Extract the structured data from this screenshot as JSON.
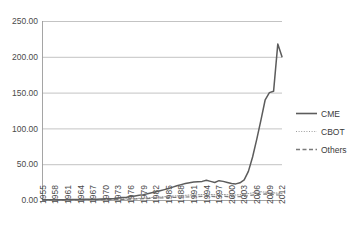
{
  "chart_data": {
    "type": "line",
    "title": "",
    "xlabel": "",
    "ylabel": "",
    "grid": true,
    "legend_position": "right",
    "ylim": [
      0,
      250
    ],
    "ytick_labels": [
      "0.00",
      "50.00",
      "100.00",
      "150.00",
      "200.00",
      "250.00"
    ],
    "ytick_values": [
      0,
      50,
      100,
      150,
      200,
      250
    ],
    "xtick_labels": [
      "1955",
      "1958",
      "1961",
      "1964",
      "1967",
      "1970",
      "1973",
      "1976",
      "1979",
      "1982",
      "1985",
      "1988",
      "1991",
      "1994",
      "1997",
      "2000",
      "2003",
      "2006",
      "2009",
      "2012"
    ],
    "x": [
      1955,
      1956,
      1957,
      1958,
      1959,
      1960,
      1961,
      1962,
      1963,
      1964,
      1965,
      1966,
      1967,
      1968,
      1969,
      1970,
      1971,
      1972,
      1973,
      1974,
      1975,
      1976,
      1977,
      1978,
      1979,
      1980,
      1981,
      1982,
      1983,
      1984,
      1985,
      1986,
      1987,
      1988,
      1989,
      1990,
      1991,
      1992,
      1993,
      1994,
      1995,
      1996,
      1997,
      1998,
      1999,
      2000,
      2001,
      2002,
      2003,
      2004,
      2005,
      2006,
      2007,
      2008,
      2009,
      2010,
      2011,
      2012
    ],
    "series": [
      {
        "name": "CME",
        "style": "solid",
        "color": "#5c5c5c",
        "values": [
          0.3,
          0.3,
          0.4,
          0.4,
          0.5,
          0.5,
          0.6,
          0.6,
          0.7,
          0.8,
          0.9,
          1.0,
          1.1,
          1.2,
          1.4,
          1.6,
          1.8,
          2.2,
          2.8,
          3.4,
          4.0,
          4.8,
          5.6,
          6.5,
          7.5,
          8.8,
          10.2,
          11.6,
          13.0,
          14.5,
          16.0,
          18.0,
          20.0,
          21.5,
          23.0,
          24.0,
          25.0,
          25.5,
          26.0,
          27.5,
          26.0,
          24.5,
          27.0,
          26.0,
          24.5,
          23.0,
          22.5,
          24.0,
          28.0,
          40.0,
          60.0,
          85.0,
          112.0,
          140.0,
          150.0,
          152.0,
          218.0,
          200.0
        ]
      },
      {
        "name": "CBOT",
        "style": "dotted",
        "color": "#9e9e9e",
        "values": [
          0.2,
          0.2,
          0.2,
          0.3,
          0.3,
          0.3,
          0.4,
          0.4,
          0.4,
          0.5,
          0.5,
          0.6,
          0.6,
          0.7,
          0.7,
          0.8,
          0.9,
          1.0,
          1.2,
          1.4,
          1.6,
          1.8,
          2.0,
          2.3,
          2.6,
          3.0,
          3.4,
          3.8,
          4.2,
          4.6,
          5.0,
          5.4,
          5.8,
          6.2,
          6.6,
          7.0,
          7.2,
          7.4,
          7.6,
          7.8,
          7.6,
          7.4,
          7.8,
          7.6,
          7.4,
          7.2,
          7.0,
          7.4,
          8.0,
          9.0,
          10.0,
          11.0,
          11.5,
          11.0,
          10.5,
          10.0,
          9.5,
          9.0
        ]
      },
      {
        "name": "Others",
        "style": "dashed",
        "color": "#7a7a7a",
        "values": [
          0.1,
          0.1,
          0.1,
          0.1,
          0.2,
          0.2,
          0.2,
          0.2,
          0.3,
          0.3,
          0.3,
          0.4,
          0.4,
          0.4,
          0.5,
          0.5,
          0.6,
          0.7,
          0.8,
          0.9,
          1.0,
          1.2,
          1.4,
          1.6,
          1.8,
          2.0,
          2.2,
          2.5,
          2.8,
          3.0,
          3.2,
          3.5,
          3.8,
          4.0,
          4.2,
          4.4,
          4.6,
          4.8,
          5.0,
          5.2,
          5.0,
          4.8,
          5.2,
          5.0,
          4.8,
          4.6,
          4.4,
          4.8,
          5.2,
          6.0,
          6.8,
          7.5,
          8.0,
          8.5,
          8.0,
          7.5,
          7.0,
          6.5
        ]
      }
    ]
  },
  "legend": {
    "items": [
      {
        "label": "CME"
      },
      {
        "label": "CBOT"
      },
      {
        "label": "Others"
      }
    ]
  }
}
